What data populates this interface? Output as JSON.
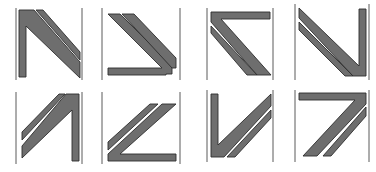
{
  "figure": {
    "colors": {
      "fill": "#6e6e6e",
      "outline": "#2e2e2e",
      "frame": "#5a5a5a",
      "background": "#ffffff"
    },
    "rows": [
      {
        "tiles": [
          {
            "id": "tile-1",
            "x": 14,
            "y": 8,
            "transform": "none"
          },
          {
            "id": "tile-2",
            "x": 105,
            "y": 8,
            "transform": "rot90cw-flip"
          },
          {
            "id": "tile-3",
            "x": 205,
            "y": 8,
            "transform": "flipV"
          },
          {
            "id": "tile-4",
            "x": 295,
            "y": 6,
            "transform": "rot180-flipH"
          }
        ]
      },
      {
        "tiles": [
          {
            "id": "tile-5",
            "x": 14,
            "y": 92,
            "transform": "flipH"
          },
          {
            "id": "tile-6",
            "x": 105,
            "y": 92,
            "transform": "rot90-a"
          },
          {
            "id": "tile-7",
            "x": 205,
            "y": 92,
            "transform": "rot180-flipV"
          },
          {
            "id": "tile-8",
            "x": 295,
            "y": 92,
            "transform": "rot180"
          }
        ]
      }
    ]
  }
}
